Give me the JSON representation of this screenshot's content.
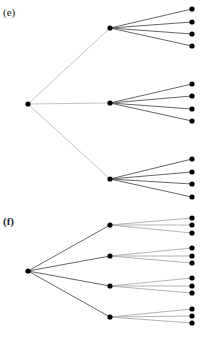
{
  "figure": {
    "width": 202,
    "height": 337,
    "node_radius": 2.6,
    "panels": [
      {
        "id": "e",
        "label": "(e)",
        "label_bold": false,
        "label_pos": [
          3,
          16
        ],
        "root": [
          28,
          104
        ],
        "root_edge_color": "#bdbdbd",
        "leaf_edge_color": "#555555",
        "root_edge_width": 0.9,
        "leaf_edge_width": 0.9,
        "children": [
          {
            "pos": [
              110,
              28
            ],
            "leaves": [
              [
                192,
                9
              ],
              [
                192,
                22
              ],
              [
                192,
                34
              ],
              [
                192,
                46
              ]
            ]
          },
          {
            "pos": [
              110,
              103
            ],
            "leaves": [
              [
                192,
                84
              ],
              [
                192,
                96
              ],
              [
                192,
                109
              ],
              [
                192,
                121
              ]
            ]
          },
          {
            "pos": [
              110,
              179
            ],
            "leaves": [
              [
                192,
                159
              ],
              [
                192,
                172
              ],
              [
                192,
                184
              ],
              [
                192,
                197
              ]
            ]
          }
        ]
      },
      {
        "id": "f",
        "label": "(f)",
        "label_bold": true,
        "label_pos": [
          3,
          225
        ],
        "root": [
          28,
          271
        ],
        "root_edge_color": "#555555",
        "leaf_edge_color": "#ababab",
        "root_edge_width": 0.9,
        "leaf_edge_width": 0.9,
        "children": [
          {
            "pos": [
              110,
              225
            ],
            "leaves": [
              [
                192,
                218
              ],
              [
                192,
                225
              ],
              [
                192,
                233
              ]
            ]
          },
          {
            "pos": [
              110,
              256
            ],
            "leaves": [
              [
                192,
                248
              ],
              [
                192,
                256
              ],
              [
                192,
                263
              ]
            ]
          },
          {
            "pos": [
              110,
              286
            ],
            "leaves": [
              [
                192,
                278
              ],
              [
                192,
                286
              ],
              [
                192,
                293
              ]
            ]
          },
          {
            "pos": [
              110,
              317
            ],
            "leaves": [
              [
                192,
                309
              ],
              [
                192,
                316
              ],
              [
                192,
                323
              ]
            ]
          }
        ]
      }
    ]
  }
}
